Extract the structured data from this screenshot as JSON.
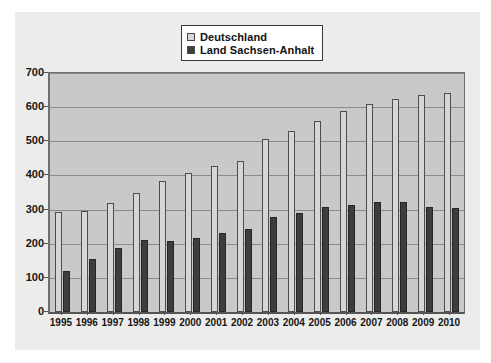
{
  "chart_data": {
    "type": "bar",
    "title": "",
    "subtitle": "",
    "xlabel": "",
    "ylabel": "",
    "ylim": [
      0,
      700
    ],
    "ytick_values": [
      0,
      100,
      200,
      300,
      400,
      500,
      600,
      700
    ],
    "ytick_labels": [
      "0",
      "100",
      "200",
      "300",
      "400",
      "500",
      "600",
      "700"
    ],
    "grid": true,
    "legend_position": "top-center",
    "categories": [
      "1995",
      "1996",
      "1997",
      "1998",
      "1999",
      "2000",
      "2001",
      "2002",
      "2003",
      "2004",
      "2005",
      "2006",
      "2007",
      "2008",
      "2009",
      "2010"
    ],
    "series": [
      {
        "name": "Deutschland",
        "color": "#d6d6d4",
        "values": [
          293,
          296,
          320,
          350,
          385,
          408,
          427,
          443,
          508,
          530,
          560,
          588,
          608,
          624,
          636,
          642
        ]
      },
      {
        "name": "Land Sachsen-Anhalt",
        "color": "#3d3d3d",
        "values": [
          120,
          155,
          188,
          210,
          208,
          218,
          230,
          243,
          278,
          290,
          308,
          312,
          322,
          322,
          308,
          306
        ]
      }
    ]
  },
  "legend": {
    "entries": [
      {
        "label": "Deutschland",
        "swatch": "#d6d6d4"
      },
      {
        "label": "Land Sachsen-Anhalt",
        "swatch": "#3d3d3d"
      }
    ]
  },
  "colors": {
    "panel_background": "#ececeb",
    "plot_background": "#c9c9c7",
    "gridline": "#8a8a88",
    "axis": "#6f6f6f",
    "text": "#161616"
  }
}
